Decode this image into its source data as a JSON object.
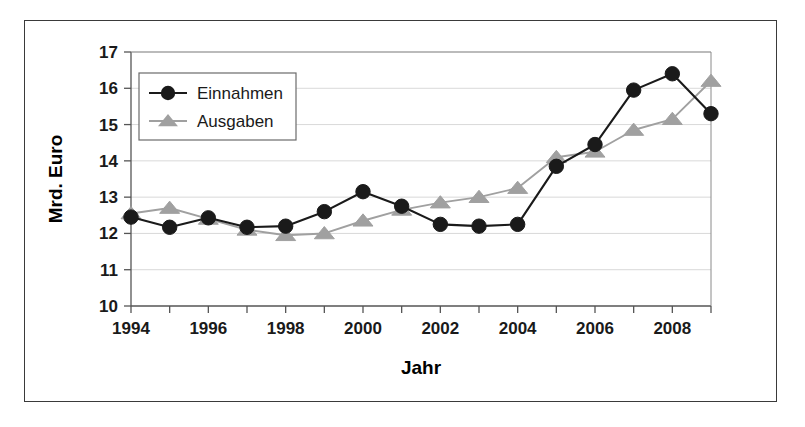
{
  "figure": {
    "background_color": "#ffffff",
    "frame_color": "#3a3a3a"
  },
  "chart_data": {
    "type": "line",
    "title": "",
    "subtitle": "",
    "xlabel": "Jahr",
    "ylabel": "Mrd. Euro",
    "x": [
      1994,
      1995,
      1996,
      1997,
      1998,
      1999,
      2000,
      2001,
      2002,
      2003,
      2004,
      2005,
      2006,
      2007,
      2008,
      2009
    ],
    "categories": [
      "1994",
      "1995",
      "1996",
      "1997",
      "1998",
      "1999",
      "2000",
      "2001",
      "2002",
      "2003",
      "2004",
      "2005",
      "2006",
      "2007",
      "2008",
      "2009"
    ],
    "xtick_labels": [
      "1994",
      "1996",
      "1998",
      "2000",
      "2002",
      "2004",
      "2006",
      "2008"
    ],
    "xtick_values": [
      1994,
      1996,
      1998,
      2000,
      2002,
      2004,
      2006,
      2008
    ],
    "ytick_labels": [
      "10",
      "11",
      "12",
      "13",
      "14",
      "15",
      "16",
      "17"
    ],
    "ytick_values": [
      10,
      11,
      12,
      13,
      14,
      15,
      16,
      17
    ],
    "xlim": [
      1993.5,
      2009.5
    ],
    "ylim": [
      10,
      17
    ],
    "grid": "horizontal",
    "grid_color": "#d9d9d9",
    "legend_position": "upper-left-inside",
    "series": [
      {
        "name": "Einnahmen",
        "color": "#1a1a1a",
        "marker": "circle",
        "values": [
          12.45,
          12.17,
          12.43,
          12.17,
          12.2,
          12.6,
          13.15,
          12.75,
          12.25,
          12.2,
          12.25,
          13.85,
          14.45,
          15.95,
          16.4,
          15.3
        ]
      },
      {
        "name": "Ausgaben",
        "color": "#a0a0a0",
        "marker": "triangle",
        "values": [
          12.55,
          12.7,
          12.4,
          12.1,
          11.95,
          12.0,
          12.35,
          12.65,
          12.85,
          13.0,
          13.25,
          14.1,
          14.25,
          14.85,
          15.15,
          16.2
        ]
      }
    ]
  },
  "legend": {
    "entries": [
      {
        "label": "Einnahmen"
      },
      {
        "label": "Ausgaben"
      }
    ]
  },
  "axes": {
    "y_axis_title": "Mrd. Euro",
    "x_axis_title": "Jahr"
  }
}
